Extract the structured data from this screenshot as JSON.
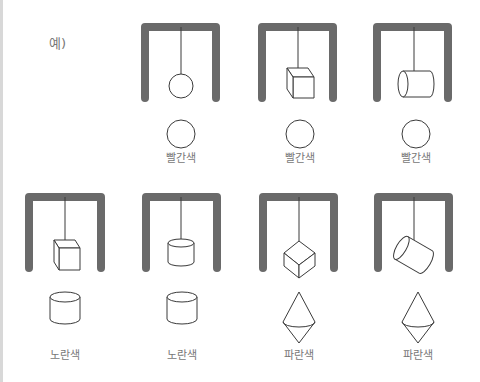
{
  "example_label": "예)",
  "panels": [
    {
      "row": 1,
      "hanging_shape": "sphere",
      "shadow_shape": "circle",
      "color_label": "빨간색"
    },
    {
      "row": 1,
      "hanging_shape": "cube",
      "shadow_shape": "circle",
      "color_label": "빨간색"
    },
    {
      "row": 1,
      "hanging_shape": "cylinder-horizontal",
      "shadow_shape": "circle",
      "color_label": "빨간색"
    },
    {
      "row": 2,
      "hanging_shape": "cube",
      "shadow_shape": "cylinder",
      "color_label": "노란색"
    },
    {
      "row": 2,
      "hanging_shape": "cylinder-upright",
      "shadow_shape": "cylinder",
      "color_label": "노란색"
    },
    {
      "row": 2,
      "hanging_shape": "cube-diagonal",
      "shadow_shape": "double-cone",
      "color_label": "파란색"
    },
    {
      "row": 2,
      "hanging_shape": "cylinder-tilted",
      "shadow_shape": "double-cone",
      "color_label": "파란색"
    }
  ],
  "colors": {
    "frame": "#6a6a6a",
    "outline": "#3a3a3a",
    "label": "#777777"
  }
}
